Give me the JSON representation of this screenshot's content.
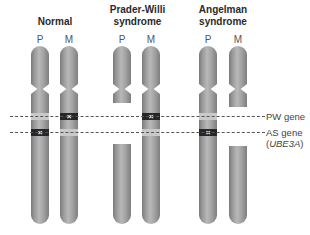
{
  "groups": [
    {
      "title_lines": [
        "Normal"
      ],
      "chromosomes": [
        {
          "label": "P",
          "pw_band": "unmarked",
          "as_band": "marked"
        },
        {
          "label": "M",
          "pw_band": "marked",
          "as_band": "unmarked"
        }
      ]
    },
    {
      "title_lines": [
        "Prader-Willi",
        "syndrome"
      ],
      "chromosomes": [
        {
          "label": "P",
          "pw_band": "deleted",
          "as_band": "deleted"
        },
        {
          "label": "M",
          "pw_band": "marked",
          "as_band": "unmarked"
        }
      ]
    },
    {
      "title_lines": [
        "Angelman",
        "syndrome"
      ],
      "chromosomes": [
        {
          "label": "P",
          "pw_band": "unmarked",
          "as_band": "marked"
        },
        {
          "label": "M",
          "pw_band": "deleted",
          "as_band": "deleted"
        }
      ]
    }
  ],
  "gene_labels": {
    "pw": "PW gene",
    "as_line1": "AS gene",
    "as_line2_open": "(",
    "as_line2_italic": "UBE3A",
    "as_line2_close": ")"
  },
  "marker_symbol": "×",
  "colors": {
    "chromosome": "#9a9a9a",
    "silenced_band": "#262626",
    "active_band": "#c9c9c9",
    "dash_line": "#555555"
  }
}
